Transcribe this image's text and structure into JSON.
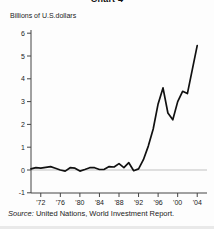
{
  "title": "Chart 4",
  "y_axis_caption": "Billions of U.S.dollars",
  "source": {
    "label": "Source:",
    "text": " United Nations, World Investment Report."
  },
  "colors": {
    "line": "#111111",
    "axis": "#444444",
    "zero_gridline": "#9a9a9a",
    "text": "#222222"
  },
  "chart_data": {
    "type": "line",
    "title": "Chart 4",
    "ylabel": "Billions of U.S.dollars",
    "xlabel": "",
    "ylim": [
      -1,
      6
    ],
    "xlim": [
      1970,
      2006
    ],
    "yticks": [
      6,
      5,
      4,
      3,
      2,
      1,
      0,
      -1
    ],
    "xtick_labels": [
      "'72",
      "'76",
      "'80",
      "'84",
      "'88",
      "'92",
      "'96",
      "'00",
      "'04"
    ],
    "xtick_years": [
      1972,
      1976,
      1980,
      1984,
      1988,
      1992,
      1996,
      2000,
      2004
    ],
    "grid": "zero-line-only",
    "legend": "none",
    "x": [
      1970,
      1971,
      1972,
      1973,
      1974,
      1975,
      1976,
      1977,
      1978,
      1979,
      1980,
      1981,
      1982,
      1983,
      1984,
      1985,
      1986,
      1987,
      1988,
      1989,
      1990,
      1991,
      1992,
      1993,
      1994,
      1995,
      1996,
      1997,
      1998,
      1999,
      2000,
      2001,
      2002,
      2003,
      2004
    ],
    "values": [
      0.05,
      0.1,
      0.08,
      0.12,
      0.15,
      0.08,
      0.0,
      -0.05,
      0.1,
      0.08,
      -0.05,
      0.02,
      0.1,
      0.1,
      0.02,
      0.03,
      0.15,
      0.13,
      0.28,
      0.1,
      0.32,
      -0.03,
      0.05,
      0.45,
      1.05,
      1.8,
      2.9,
      3.6,
      2.5,
      2.2,
      3.0,
      3.45,
      3.35,
      4.4,
      5.45
    ]
  },
  "geometry": {
    "svg_width": 214,
    "svg_height": 229,
    "axis_x": 31,
    "axis_top_y": 30,
    "baseline_y": 193,
    "zero_y": 170,
    "px_per_unit_y": 22.8,
    "plot_right_x": 207
  }
}
